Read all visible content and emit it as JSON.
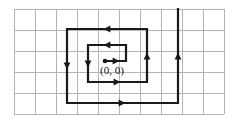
{
  "figure": {
    "name": "rectangular-spiral-on-grid",
    "background_color": "#ffffff",
    "width": 226,
    "height": 123
  },
  "grid": {
    "line_color": "#b4b4b4",
    "cell_size": 21,
    "x_start": 14,
    "y_start": 9,
    "columns": 10,
    "rows": 5,
    "vertical_count": 11,
    "horizontal_count": 6
  },
  "labels": {
    "origin": "(0, 0)",
    "origin_x": 90,
    "origin_y": 74
  },
  "chart_data": {
    "type": "line",
    "title": "",
    "xlabel": "",
    "ylabel": "",
    "grid": true,
    "legend": "none",
    "origin_point": [
      0,
      0
    ],
    "stroke_color": "#1a1a1a",
    "stroke_width": 2.2,
    "path_points": [
      [
        105,
        61
      ],
      [
        126,
        61
      ],
      [
        126,
        45
      ],
      [
        88,
        45
      ],
      [
        88,
        82
      ],
      [
        147,
        82
      ],
      [
        147,
        29
      ],
      [
        67,
        29
      ],
      [
        67,
        103
      ],
      [
        178,
        103
      ],
      [
        178,
        9
      ]
    ],
    "arrows": [
      {
        "x": 116,
        "y": 61,
        "dir": "right"
      },
      {
        "x": 107,
        "y": 45,
        "dir": "left"
      },
      {
        "x": 88,
        "y": 64,
        "dir": "down"
      },
      {
        "x": 117,
        "y": 82,
        "dir": "right"
      },
      {
        "x": 147,
        "y": 56,
        "dir": "up"
      },
      {
        "x": 107,
        "y": 29,
        "dir": "left"
      },
      {
        "x": 67,
        "y": 66,
        "dir": "down"
      },
      {
        "x": 122,
        "y": 103,
        "dir": "right"
      },
      {
        "x": 178,
        "y": 56,
        "dir": "up"
      }
    ]
  }
}
